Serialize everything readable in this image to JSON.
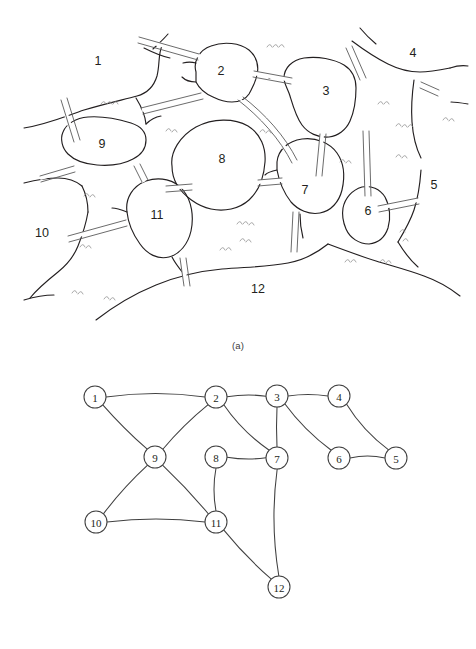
{
  "figure": {
    "panels": [
      {
        "id": "map",
        "caption": "(a)",
        "type": "land-and-bridges-map",
        "region_labels": [
          {
            "text": "1",
            "x": 98,
            "y": 62
          },
          {
            "text": "2",
            "x": 221,
            "y": 72
          },
          {
            "text": "3",
            "x": 326,
            "y": 92
          },
          {
            "text": "4",
            "x": 413,
            "y": 54
          },
          {
            "text": "5",
            "x": 434,
            "y": 186
          },
          {
            "text": "6",
            "x": 368,
            "y": 212
          },
          {
            "text": "7",
            "x": 305,
            "y": 191
          },
          {
            "text": "8",
            "x": 222,
            "y": 160
          },
          {
            "text": "9",
            "x": 102,
            "y": 145
          },
          {
            "text": "10",
            "x": 42,
            "y": 234
          },
          {
            "text": "11",
            "x": 157,
            "y": 216
          },
          {
            "text": "12",
            "x": 258,
            "y": 290
          }
        ]
      },
      {
        "id": "graph",
        "caption": "(b)",
        "type": "node-link-graph",
        "nodes": [
          {
            "id": "1",
            "label": "1",
            "x": 95,
            "y": 52
          },
          {
            "id": "2",
            "label": "2",
            "x": 216,
            "y": 52
          },
          {
            "id": "3",
            "label": "3",
            "x": 277,
            "y": 51
          },
          {
            "id": "4",
            "label": "4",
            "x": 339,
            "y": 51
          },
          {
            "id": "5",
            "label": "5",
            "x": 396,
            "y": 113
          },
          {
            "id": "6",
            "label": "6",
            "x": 339,
            "y": 113
          },
          {
            "id": "7",
            "label": "7",
            "x": 277,
            "y": 113
          },
          {
            "id": "8",
            "label": "8",
            "x": 216,
            "y": 112
          },
          {
            "id": "9",
            "label": "9",
            "x": 155,
            "y": 112
          },
          {
            "id": "10",
            "label": "10",
            "x": 96,
            "y": 177
          },
          {
            "id": "11",
            "label": "11",
            "x": 216,
            "y": 177
          },
          {
            "id": "12",
            "label": "12",
            "x": 279,
            "y": 242
          }
        ],
        "edges": [
          {
            "from": "1",
            "to": "2"
          },
          {
            "from": "1",
            "to": "9"
          },
          {
            "from": "2",
            "to": "3"
          },
          {
            "from": "2",
            "to": "7"
          },
          {
            "from": "2",
            "to": "9"
          },
          {
            "from": "3",
            "to": "4"
          },
          {
            "from": "3",
            "to": "6"
          },
          {
            "from": "3",
            "to": "7"
          },
          {
            "from": "4",
            "to": "5"
          },
          {
            "from": "5",
            "to": "6"
          },
          {
            "from": "7",
            "to": "8"
          },
          {
            "from": "7",
            "to": "12"
          },
          {
            "from": "8",
            "to": "11"
          },
          {
            "from": "9",
            "to": "10"
          },
          {
            "from": "9",
            "to": "11"
          },
          {
            "from": "10",
            "to": "11"
          },
          {
            "from": "11",
            "to": "12"
          }
        ],
        "node_radius": 11
      }
    ]
  },
  "colors": {
    "ink": "#231f20",
    "coastline": "#231f20",
    "bridge": "#5a5a5a",
    "grass": "#8d8d8d",
    "graph_line": "#404040",
    "background": "#ffffff"
  }
}
